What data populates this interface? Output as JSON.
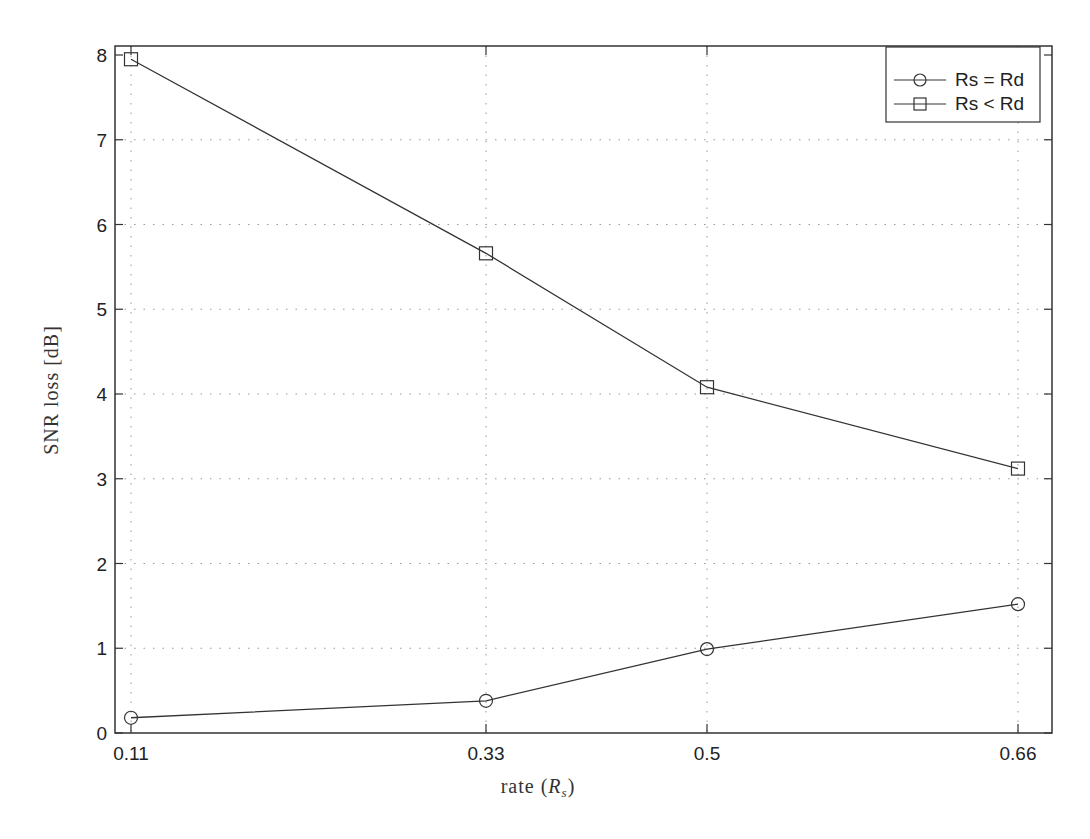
{
  "chart_data": {
    "type": "line",
    "title": "",
    "xlabel": "rate (R_s)",
    "xlabel_main": "rate (",
    "xlabel_sym": "R",
    "xlabel_sub": "s",
    "xlabel_close": ")",
    "ylabel": "SNR loss [dB]",
    "x": [
      0.11,
      0.33,
      0.5,
      0.66
    ],
    "x_tick_labels": [
      "0.11",
      "0.33",
      "0.5",
      "0.66"
    ],
    "y_ticks": [
      0,
      1,
      2,
      3,
      4,
      5,
      6,
      7,
      8
    ],
    "y_tick_labels": [
      "0",
      "1",
      "2",
      "3",
      "4",
      "5",
      "6",
      "7",
      "8"
    ],
    "ylim": [
      0,
      8
    ],
    "grid": true,
    "legend_position": "upper right",
    "series": [
      {
        "name": "Rs = Rd",
        "marker": "circle",
        "values": [
          0.18,
          0.38,
          0.99,
          1.52
        ]
      },
      {
        "name": "Rs < Rd",
        "marker": "square",
        "values": [
          7.95,
          5.66,
          4.08,
          3.12
        ]
      }
    ]
  },
  "colors": {
    "line": "#333333",
    "grid": "#999999",
    "axis": "#333333"
  }
}
